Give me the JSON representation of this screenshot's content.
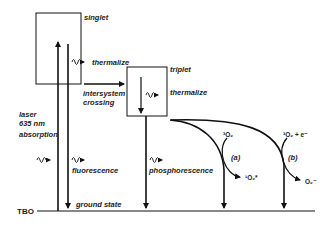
{
  "diagram": {
    "type": "jablonski-energy-diagram",
    "states": {
      "singlet": "singlet",
      "triplet": "triplet",
      "ground": "ground state",
      "molecule": "TBO"
    },
    "labels": {
      "thermalize_singlet": "thermalize",
      "thermalize_triplet": "thermalize",
      "isc_line1": "intersystem",
      "isc_line2": "crossing",
      "laser_line1": "laser",
      "laser_line2": "635 nm",
      "absorption": "absorption",
      "fluorescence": "fluorescence",
      "phosphorescence": "phosphorescence"
    },
    "pathways": {
      "a_label": "(a)",
      "a_reactant": "³O₂",
      "a_product": "¹O₂*",
      "b_label": "(b)",
      "b_reactant": "³O₂ + e⁻",
      "b_product": "O₂⁻"
    },
    "colors": {
      "line": "#111111",
      "text": "#222222",
      "background": "#ffffff"
    }
  }
}
